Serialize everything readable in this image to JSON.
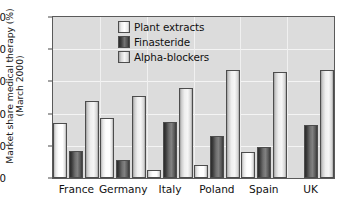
{
  "chart_data": {
    "type": "bar",
    "title": "",
    "xlabel": "",
    "ylabel": "Market share medical therapy (%)",
    "ylabel_line2": "(March 2000)",
    "ylim": [
      0,
      100
    ],
    "yticks": [
      0,
      20,
      40,
      60,
      80,
      100
    ],
    "ytick_labels": [
      "0",
      "20",
      "40",
      "60",
      "80",
      "100"
    ],
    "grid": true,
    "grid_axis": "both",
    "legend_position": "upper center",
    "categories": [
      "France",
      "Germany",
      "Italy",
      "Poland",
      "Spain",
      "UK"
    ],
    "series": [
      {
        "name": "Plant extracts",
        "swatch": "plant",
        "color": "#ffffff",
        "values": [
          34,
          37,
          5,
          8,
          16,
          0
        ]
      },
      {
        "name": "Finasteride",
        "swatch": "fina",
        "color": "#4d4d4d",
        "values": [
          17,
          11,
          35,
          26,
          19,
          33
        ]
      },
      {
        "name": "Alpha-blockers",
        "swatch": "alpha",
        "color": "#e8e8e8",
        "values": [
          48,
          51,
          56,
          67,
          66,
          67
        ]
      }
    ]
  },
  "figure": {
    "background": "#ffffff",
    "plot_background": "#dcdcdc",
    "axis_color": "#5a5a5a",
    "gridline_color": "#f4f4f4"
  }
}
